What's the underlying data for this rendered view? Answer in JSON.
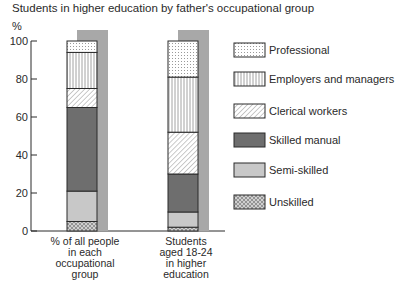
{
  "chart_data": {
    "type": "bar",
    "stacked": true,
    "title": "Students in higher education by father's occupational group",
    "ylabel": "%",
    "xlabel": "",
    "ylim": [
      0,
      100
    ],
    "yticks": [
      0,
      20,
      40,
      60,
      80,
      100
    ],
    "grid": false,
    "legend_position": "right",
    "categories": [
      [
        "% of all people",
        "in each",
        "occupational",
        "group"
      ],
      [
        "Students",
        "aged 18-24",
        "in higher",
        "education"
      ]
    ],
    "series": [
      {
        "name": "Unskilled",
        "pattern": "crosshatch",
        "color": "#b4b4b4",
        "values": [
          5,
          2
        ]
      },
      {
        "name": "Semi-skilled",
        "pattern": "solid",
        "color": "#c8c8c8",
        "values": [
          16,
          8
        ]
      },
      {
        "name": "Skilled manual",
        "pattern": "solid",
        "color": "#6e6e6e",
        "values": [
          44,
          20
        ]
      },
      {
        "name": "Clerical workers",
        "pattern": "diagonal",
        "color": "#ffffff",
        "values": [
          10,
          22
        ]
      },
      {
        "name": "Employers and managers",
        "pattern": "vertical",
        "color": "#ffffff",
        "values": [
          19,
          29
        ]
      },
      {
        "name": "Professional",
        "pattern": "dots",
        "color": "#ffffff",
        "values": [
          6,
          19
        ]
      }
    ],
    "legend_order": [
      "Professional",
      "Employers and managers",
      "Clerical workers",
      "Skilled manual",
      "Semi-skilled",
      "Unskilled"
    ],
    "shadow_color": "#a8a8a8"
  }
}
